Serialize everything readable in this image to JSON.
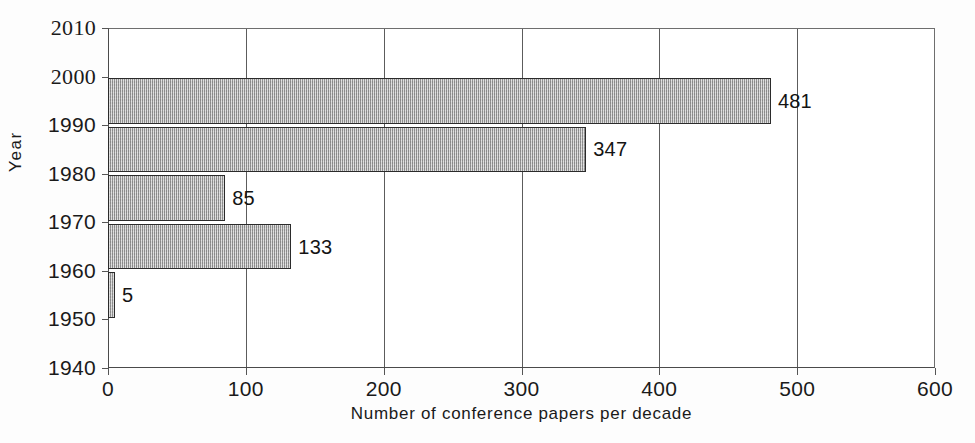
{
  "chart_data": {
    "type": "bar",
    "orientation": "horizontal",
    "title": "",
    "xlabel": "Number of conference papers per decade",
    "ylabel": "Year",
    "categories": [
      "1940",
      "1950",
      "1960",
      "1970",
      "1980",
      "1990",
      "2000"
    ],
    "values": [
      0,
      5,
      133,
      85,
      347,
      481,
      0
    ],
    "bars": [
      {
        "decade_start": "1950",
        "decade_end": "1960",
        "value": 5,
        "label": "5"
      },
      {
        "decade_start": "1960",
        "decade_end": "1970",
        "value": 133,
        "label": "133"
      },
      {
        "decade_start": "1970",
        "decade_end": "1980",
        "value": 85,
        "label": "85"
      },
      {
        "decade_start": "1980",
        "decade_end": "1990",
        "value": 347,
        "label": "347"
      },
      {
        "decade_start": "1990",
        "decade_end": "2000",
        "value": 481,
        "label": "481"
      }
    ],
    "xlim": [
      0,
      600
    ],
    "ylim": [
      1940,
      2010
    ],
    "xticks": [
      "0",
      "100",
      "200",
      "300",
      "400",
      "500",
      "600"
    ],
    "yticks": [
      "1940",
      "1950",
      "1960",
      "1970",
      "1980",
      "1990",
      "2000",
      "2010"
    ],
    "grid": {
      "vertical": true,
      "horizontal": false
    },
    "legend": null,
    "bar_fill": "#b4b4b4",
    "bar_border": "#2b2b2b",
    "axis_color": "#4a4a4a"
  },
  "axes": {
    "y_title": "Year",
    "x_title": "Number of conference papers per decade",
    "y_ticks": [
      {
        "label": "2010",
        "value": 2010
      },
      {
        "label": "2000",
        "value": 2000
      },
      {
        "label": "1990",
        "value": 1990
      },
      {
        "label": "1980",
        "value": 1980
      },
      {
        "label": "1970",
        "value": 1970
      },
      {
        "label": "1960",
        "value": 1960
      },
      {
        "label": "1950",
        "value": 1950
      },
      {
        "label": "1940",
        "value": 1940
      }
    ],
    "x_ticks": [
      {
        "label": "0",
        "value": 0
      },
      {
        "label": "100",
        "value": 100
      },
      {
        "label": "200",
        "value": 200
      },
      {
        "label": "300",
        "value": 300
      },
      {
        "label": "400",
        "value": 400
      },
      {
        "label": "500",
        "value": 500
      },
      {
        "label": "600",
        "value": 600
      }
    ]
  },
  "caption_strip": ""
}
